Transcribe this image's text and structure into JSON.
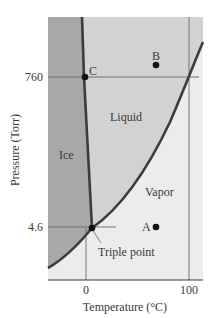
{
  "diagram": {
    "type": "phase-diagram",
    "xlabel": "Temperature (°C)",
    "ylabel": "Pressure (Torr)",
    "x_ticks": [
      "0",
      "100"
    ],
    "y_ticks": [
      "760",
      "4.6"
    ],
    "regions": {
      "ice": "Ice",
      "liquid": "Liquid",
      "vapor": "Vapor"
    },
    "points": {
      "a": "A",
      "b": "B",
      "c": "C"
    },
    "annotations": {
      "triple_point": "Triple point"
    },
    "colors": {
      "ice": "#a8a8a8",
      "liquid": "#d2d2d2",
      "vapor": "#ececec",
      "curve": "#3c3c3c",
      "gridline": "#6a6a6a"
    }
  }
}
